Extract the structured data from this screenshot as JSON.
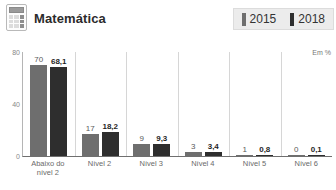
{
  "header": {
    "icon": "calculator-icon",
    "title": "Matemática",
    "legend": {
      "items": [
        {
          "label": "2015",
          "color": "#6e6e6e"
        },
        {
          "label": "2018",
          "color": "#2e2e2e"
        }
      ]
    }
  },
  "chart_data": {
    "type": "bar",
    "title": "Matemática",
    "xlabel": "",
    "ylabel": "",
    "unit_note": "Em %",
    "ylim": [
      0,
      80
    ],
    "yticks": [
      0,
      40,
      80
    ],
    "ytick_labels": [
      "0",
      "40",
      "80"
    ],
    "grid": "vertical-separators",
    "legend_position": "top-right",
    "categories": [
      "Abaixo do nível 2",
      "Nível 2",
      "Nível 3",
      "Nível 4",
      "Nível 5",
      "Nível 6"
    ],
    "category_lines": [
      [
        "Abaixo do",
        "nível 2"
      ],
      [
        "Nível 2"
      ],
      [
        "Nível 3"
      ],
      [
        "Nível 4"
      ],
      [
        "Nível 5"
      ],
      [
        "Nível 6"
      ]
    ],
    "series": [
      {
        "name": "2015",
        "color": "#6e6e6e",
        "values": [
          70,
          17,
          9,
          3,
          1,
          0
        ],
        "labels": [
          "70",
          "17",
          "9",
          "3",
          "1",
          "0"
        ]
      },
      {
        "name": "2018",
        "color": "#2e2e2e",
        "values": [
          68.1,
          18.2,
          9.3,
          3.4,
          0.8,
          0.1
        ],
        "labels": [
          "68,1",
          "18,2",
          "9,3",
          "3,4",
          "0,8",
          "0,1"
        ]
      }
    ]
  }
}
